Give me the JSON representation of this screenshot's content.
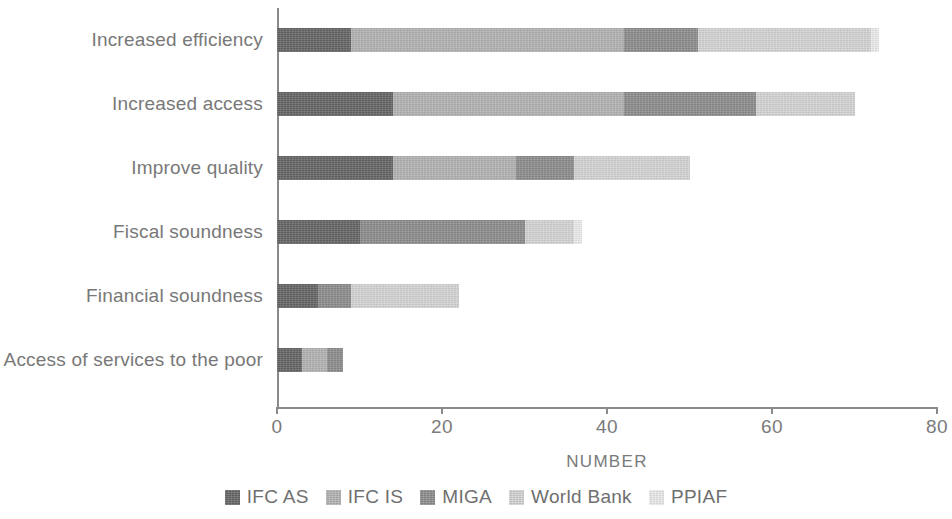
{
  "chart_data": {
    "type": "bar",
    "orientation": "horizontal",
    "stacked": true,
    "title": "",
    "xlabel": "NUMBER",
    "ylabel": "",
    "xlim": [
      0,
      80
    ],
    "xticks": [
      0,
      20,
      40,
      60,
      80
    ],
    "xtick_labels": [
      "0",
      "20",
      "40",
      "60",
      "80"
    ],
    "grid": false,
    "legend_position": "bottom",
    "categories": [
      "Increased efficiency",
      "Increased access",
      "Improve quality",
      "Fiscal soundness",
      "Financial soundness",
      "Access of services to the poor"
    ],
    "series": [
      {
        "name": "IFC AS",
        "color": "#686868",
        "values": [
          9,
          14,
          14,
          10,
          5,
          3
        ]
      },
      {
        "name": "IFC IS",
        "color": "#b5b5b5",
        "values": [
          33,
          28,
          15,
          0,
          0,
          3
        ]
      },
      {
        "name": "MIGA",
        "color": "#8f8f8f",
        "values": [
          9,
          16,
          7,
          20,
          4,
          2
        ]
      },
      {
        "name": "World Bank",
        "color": "#d6d6d6",
        "values": [
          21,
          12,
          14,
          6,
          13,
          0
        ]
      },
      {
        "name": "PPIAF",
        "color": "#ededed",
        "values": [
          1,
          0,
          0,
          1,
          0,
          0
        ]
      }
    ],
    "totals": [
      73,
      70,
      50,
      37,
      22,
      8
    ]
  },
  "legend": {
    "items": [
      {
        "label": "IFC AS",
        "swatch": "legend-swatch-ifc-as"
      },
      {
        "label": "IFC IS",
        "swatch": "legend-swatch-ifc-is"
      },
      {
        "label": "MIGA",
        "swatch": "legend-swatch-miga"
      },
      {
        "label": "World Bank",
        "swatch": "legend-swatch-world-bank"
      },
      {
        "label": "PPIAF",
        "swatch": "legend-swatch-ppiaf"
      }
    ]
  }
}
